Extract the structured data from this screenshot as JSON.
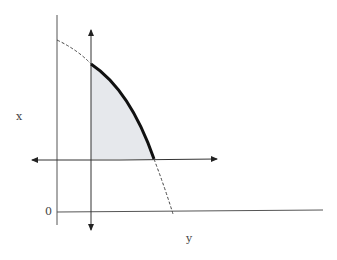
{
  "diagram": {
    "labels": {
      "x_axis_label": "x",
      "y_axis_label": "y",
      "origin_label": "0"
    },
    "colors": {
      "axis": "#555555",
      "curve": "#111111",
      "region_fill": "#e6e8ec",
      "dashed": "#444444"
    },
    "elements": [
      "left vertical axis",
      "bottom horizontal axis",
      "vertical double-headed arrow",
      "horizontal double-headed arrow",
      "bold curve bounding shaded region",
      "dashed extension of curve"
    ]
  }
}
